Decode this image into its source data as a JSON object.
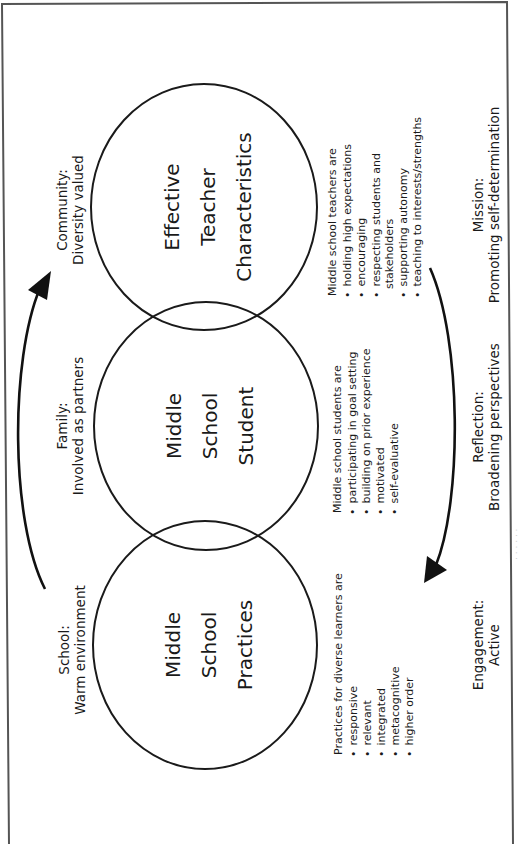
{
  "diagram": {
    "orientation": "rotated 90deg counter-clockwise",
    "circles": [
      {
        "id": "teacher",
        "lines": [
          "Effective",
          "Teacher",
          "Characteristics"
        ],
        "list_title": "Middle school teachers are",
        "items": [
          "holding high expectations",
          "encouraging",
          "respecting students and",
          "supporting autonomy",
          "teaching to interests/strengths"
        ],
        "item_continuations": {
          "2": "stakeholders"
        }
      },
      {
        "id": "student",
        "lines": [
          "Middle",
          "School",
          "Student"
        ],
        "list_title": "Middle school students are",
        "items": [
          "participating in goal setting",
          "building on prior experience",
          "motivated",
          "self-evaluative"
        ]
      },
      {
        "id": "practices",
        "lines": [
          "Middle",
          "School",
          "Practices"
        ],
        "list_title": "Practices for diverse learners are",
        "items": [
          "responsive",
          "relevant",
          "integrated",
          "metacognitive",
          "higher order"
        ]
      }
    ],
    "outer_labels_left": [
      {
        "heading": "Community:",
        "sub": "Diversity valued"
      },
      {
        "heading": "Family:",
        "sub": "Involved as partners"
      },
      {
        "heading": "School:",
        "sub": "Warm environment"
      }
    ],
    "outer_labels_right": [
      {
        "heading": "Mission:",
        "sub": "Promoting self-determination"
      },
      {
        "heading": "Reflection:",
        "sub": "Broadening perspectives"
      },
      {
        "heading": "Engagement:",
        "sub": "Active"
      }
    ],
    "arrows": [
      {
        "name": "left-cycle-arrow",
        "direction": "upward (School → Community)"
      },
      {
        "name": "right-cycle-arrow",
        "direction": "downward (Mission → Engagement)"
      }
    ],
    "bullet": "•",
    "colors": {
      "ink": "#1a1a1a",
      "frame": "#555555",
      "background": "#ffffff"
    }
  }
}
